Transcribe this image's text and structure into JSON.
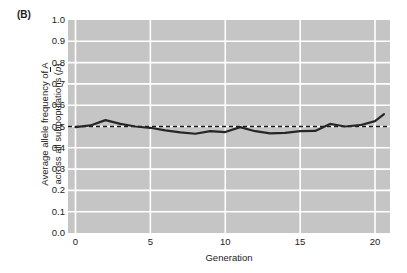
{
  "figure": {
    "panel_label": "(B)",
    "background_color": "#ffffff",
    "plot_background_color": "#c5c5c5",
    "gridline_color": "#ffffff",
    "line_color": "#262626",
    "reference_line_color": "#1a1a1a",
    "text_color": "#1c1c1c"
  },
  "ylabel": {
    "line1": "Average allele frequency of A",
    "line2_pre": "across all subpopulations (",
    "line2_symbol": "p",
    "line2_post": ")"
  },
  "chart_data": {
    "type": "line",
    "title": "",
    "subtitle": "",
    "xlabel": "Generation",
    "ylabel": "Average allele frequency of A across all subpopulations (p̄)",
    "xlim": [
      -0.5,
      21.0
    ],
    "ylim": [
      0.0,
      1.0
    ],
    "grid": true,
    "legend_position": "none",
    "xticks": [
      0,
      5,
      10,
      15,
      20
    ],
    "xtick_labels": [
      "0",
      "5",
      "10",
      "15",
      "20"
    ],
    "yticks": [
      0.0,
      0.1,
      0.2,
      0.3,
      0.4,
      0.5,
      0.6,
      0.7,
      0.8,
      0.9,
      1.0
    ],
    "ytick_labels": [
      "0.0",
      "0.1",
      "0.2",
      "0.3",
      "0.4",
      "0.5",
      "0.6",
      "0.7",
      "0.8",
      "0.9",
      "1.0"
    ],
    "annotations": [
      {
        "kind": "horizontal-reference-line",
        "style": "dashed",
        "y": 0.5,
        "label": ""
      }
    ],
    "x": [
      0,
      1,
      2,
      3,
      4,
      5,
      6,
      7,
      8,
      9,
      10,
      11,
      12,
      13,
      14,
      15,
      16,
      17,
      18,
      19,
      20
    ],
    "series": [
      {
        "name": "Average allele frequency of A",
        "values": [
          0.497,
          0.505,
          0.53,
          0.512,
          0.5,
          0.494,
          0.482,
          0.472,
          0.466,
          0.478,
          0.474,
          0.497,
          0.478,
          0.468,
          0.47,
          0.478,
          0.479,
          0.512,
          0.5,
          0.506,
          0.525
        ],
        "color": "#262626",
        "style": "solid",
        "width": 2.2,
        "markers": "none"
      }
    ],
    "series_extra_point": {
      "x": 20.6,
      "y": 0.558,
      "note": "line continues slightly past the generation-20 tick to the panel edge"
    }
  },
  "xlabel": "Generation"
}
